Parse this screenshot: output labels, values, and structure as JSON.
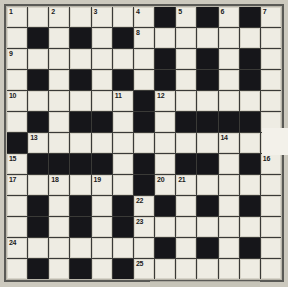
{
  "puzzle": {
    "type": "crossword-grid",
    "columns": 13,
    "rows": 13,
    "colors": {
      "page_background": "#c9c6bb",
      "grid_border": "#5a5a56",
      "white_cell": "#eeece3",
      "black_cell": "#16161a",
      "grid_line": "#3a3a37",
      "number_text": "#1b1b1b",
      "overlay_patch": "#f3f1ea"
    },
    "legend": {
      "white": "open letter square",
      "black": "blocked square"
    },
    "cells": [
      [
        "white",
        "white",
        "white",
        "white",
        "white",
        "white",
        "white",
        "black",
        "white",
        "black",
        "white",
        "black",
        "white"
      ],
      [
        "white",
        "black",
        "white",
        "black",
        "white",
        "black",
        "white",
        "white",
        "white",
        "white",
        "white",
        "white",
        "white"
      ],
      [
        "white",
        "white",
        "white",
        "white",
        "white",
        "white",
        "white",
        "black",
        "white",
        "black",
        "white",
        "black",
        "white"
      ],
      [
        "white",
        "black",
        "white",
        "black",
        "white",
        "black",
        "white",
        "black",
        "white",
        "black",
        "white",
        "black",
        "white"
      ],
      [
        "white",
        "white",
        "white",
        "white",
        "white",
        "white",
        "black",
        "white",
        "white",
        "white",
        "white",
        "white",
        "white"
      ],
      [
        "white",
        "black",
        "white",
        "black",
        "black",
        "white",
        "black",
        "white",
        "black",
        "black",
        "black",
        "black",
        "white"
      ],
      [
        "black",
        "white",
        "white",
        "white",
        "white",
        "white",
        "white",
        "white",
        "white",
        "white",
        "white",
        "white",
        "white"
      ],
      [
        "white",
        "black",
        "black",
        "black",
        "black",
        "white",
        "black",
        "white",
        "black",
        "black",
        "white",
        "black",
        "white"
      ],
      [
        "white",
        "white",
        "white",
        "white",
        "white",
        "white",
        "black",
        "white",
        "white",
        "white",
        "white",
        "white",
        "white"
      ],
      [
        "white",
        "black",
        "white",
        "black",
        "white",
        "black",
        "white",
        "black",
        "white",
        "black",
        "white",
        "black",
        "white"
      ],
      [
        "white",
        "black",
        "white",
        "black",
        "white",
        "black",
        "white",
        "white",
        "white",
        "white",
        "white",
        "white",
        "white"
      ],
      [
        "white",
        "white",
        "white",
        "white",
        "white",
        "white",
        "white",
        "black",
        "white",
        "black",
        "white",
        "black",
        "white"
      ],
      [
        "white",
        "black",
        "white",
        "black",
        "white",
        "black",
        "white",
        "white",
        "white",
        "white",
        "white",
        "white",
        "white"
      ]
    ],
    "numbers": [
      {
        "row": 1,
        "col": 1,
        "label": "1"
      },
      {
        "row": 1,
        "col": 3,
        "label": "2"
      },
      {
        "row": 1,
        "col": 5,
        "label": "3"
      },
      {
        "row": 1,
        "col": 7,
        "label": "4"
      },
      {
        "row": 1,
        "col": 9,
        "label": "5"
      },
      {
        "row": 1,
        "col": 11,
        "label": "6"
      },
      {
        "row": 1,
        "col": 13,
        "label": "7"
      },
      {
        "row": 2,
        "col": 7,
        "label": "8"
      },
      {
        "row": 3,
        "col": 1,
        "label": "9"
      },
      {
        "row": 5,
        "col": 1,
        "label": "10"
      },
      {
        "row": 5,
        "col": 6,
        "label": "11"
      },
      {
        "row": 5,
        "col": 8,
        "label": "12"
      },
      {
        "row": 7,
        "col": 2,
        "label": "13"
      },
      {
        "row": 7,
        "col": 11,
        "label": "14"
      },
      {
        "row": 8,
        "col": 1,
        "label": "15"
      },
      {
        "row": 8,
        "col": 13,
        "label": "16"
      },
      {
        "row": 9,
        "col": 1,
        "label": "17"
      },
      {
        "row": 9,
        "col": 3,
        "label": "18"
      },
      {
        "row": 9,
        "col": 5,
        "label": "19"
      },
      {
        "row": 9,
        "col": 8,
        "label": "20"
      },
      {
        "row": 9,
        "col": 9,
        "label": "21"
      },
      {
        "row": 10,
        "col": 7,
        "label": "22"
      },
      {
        "row": 11,
        "col": 7,
        "label": "23"
      },
      {
        "row": 12,
        "col": 1,
        "label": "24"
      },
      {
        "row": 13,
        "col": 7,
        "label": "25"
      }
    ]
  }
}
